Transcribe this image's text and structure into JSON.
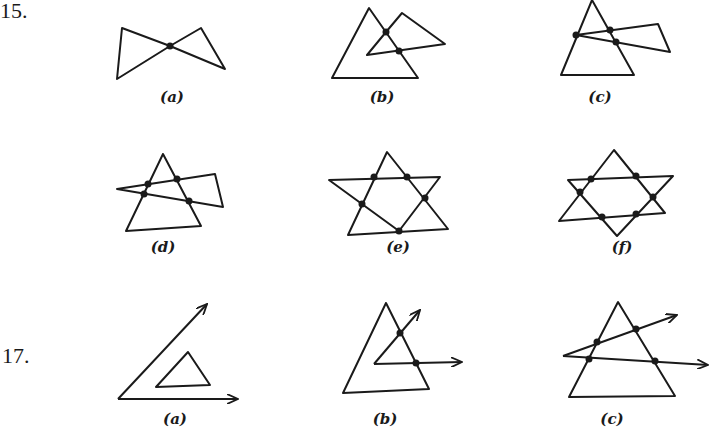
{
  "problems": [
    {
      "number": "15.",
      "figures": [
        {
          "label": "(a)",
          "description": "bowtie of two triangles meeting at one vertex",
          "intersection_points": 1
        },
        {
          "label": "(b)",
          "description": "two overlapping triangles",
          "intersection_points": 2
        },
        {
          "label": "(c)",
          "description": "triangle and overlapping triangle sharing a point",
          "intersection_points": 3
        },
        {
          "label": "(d)",
          "description": "two triangles overlapping",
          "intersection_points": 4
        },
        {
          "label": "(e)",
          "description": "two triangles overlapping",
          "intersection_points": 5
        },
        {
          "label": "(f)",
          "description": "six-pointed star of two triangles",
          "intersection_points": 6
        }
      ]
    },
    {
      "number": "17.",
      "figures": [
        {
          "label": "(a)",
          "description": "angle with triangle in interior",
          "intersection_points": 0
        },
        {
          "label": "(b)",
          "description": "angle and triangle",
          "intersection_points": 2
        },
        {
          "label": "(c)",
          "description": "angle and triangle",
          "intersection_points": 4
        }
      ]
    }
  ],
  "colors": {
    "ink": "#1a1a1a",
    "background": "#ffffff"
  }
}
